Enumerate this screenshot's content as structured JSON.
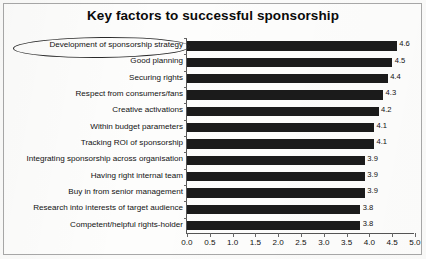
{
  "chart_data": {
    "type": "bar",
    "orientation": "horizontal",
    "title": "Key factors to successful sponsorship",
    "xlabel": "",
    "ylabel": "",
    "xlim": [
      0.0,
      5.0
    ],
    "xticks": [
      "0.0",
      "0.5",
      "1.0",
      "1.5",
      "2.0",
      "2.5",
      "3.0",
      "3.5",
      "4.0",
      "4.5",
      "5.0"
    ],
    "grid": false,
    "legend": false,
    "bar_color": "#1b1b1b",
    "categories": [
      "Development of sponsorship strategy",
      "Good planning",
      "Securing rights",
      "Respect from consumers/fans",
      "Creative activations",
      "Within budget parameters",
      "Tracking ROI of sponsorship",
      "Integrating sponsorship across organisation",
      "Having right internal team",
      "Buy in from senior management",
      "Research into interests of target audience",
      "Competent/helpful rights-holder"
    ],
    "values": [
      4.6,
      4.5,
      4.4,
      4.3,
      4.2,
      4.1,
      4.1,
      3.9,
      3.9,
      3.9,
      3.8,
      3.8
    ],
    "value_labels": [
      "4.6",
      "4.5",
      "4.4",
      "4.3",
      "4.2",
      "4.1",
      "4.1",
      "3.9",
      "3.9",
      "3.9",
      "3.8",
      "3.8"
    ],
    "annotations": [
      {
        "type": "ellipse",
        "target": "Development of sponsorship strategy",
        "name": "highlight-ellipse"
      }
    ]
  }
}
